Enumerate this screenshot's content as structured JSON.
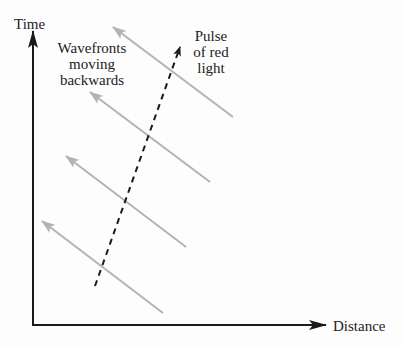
{
  "diagram": {
    "axes": {
      "y_label": "Time",
      "x_label": "Distance",
      "color": "#1a1a1a"
    },
    "annotations": {
      "wavefronts_label": [
        "Wavefronts",
        "moving",
        "backwards"
      ],
      "pulse_label": [
        "Pulse",
        "of red",
        "light"
      ]
    },
    "wavefronts": {
      "color": "#b3b3b3",
      "count": 4,
      "direction": "up-left (backwards)"
    },
    "pulse": {
      "style": "dashed",
      "color": "#1a1a1a",
      "direction": "up-right"
    }
  }
}
